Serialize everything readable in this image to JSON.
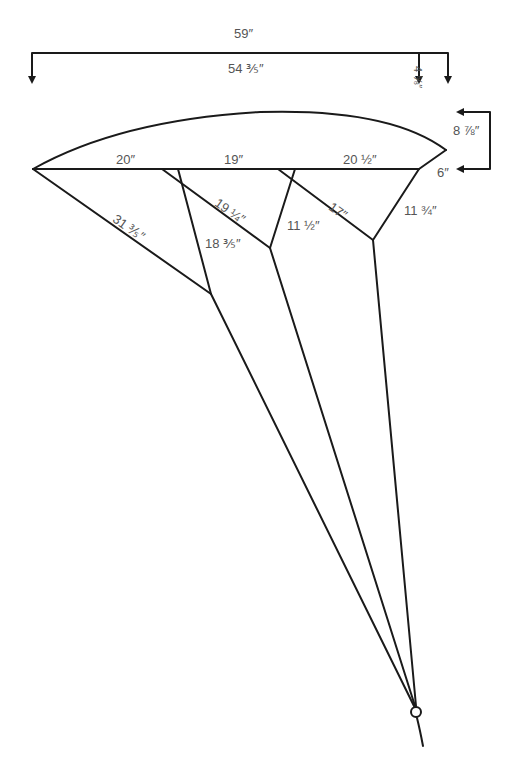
{
  "diagram": {
    "type": "kite-bridle-dimension-drawing",
    "line_color": "#1a1a1a",
    "label_color": "#555555",
    "overall_dimensions": {
      "total_span": "59″",
      "span_to_inner_mark": "54 ⅗″",
      "right_offset": "4 ⅝″",
      "wing_height": "8 ⅞″",
      "trailing_tip": "6″"
    },
    "baseline_segments": [
      {
        "label": "20″"
      },
      {
        "label": "19″"
      },
      {
        "label": "20 ½″"
      }
    ],
    "bridle_lines": [
      {
        "label": "31 ⅗″"
      },
      {
        "label": "19 ¼″"
      },
      {
        "label": "18 ⅗″"
      },
      {
        "label": "11 ½″"
      },
      {
        "label": "17″"
      },
      {
        "label": "11 ¾″"
      }
    ],
    "tow_point": "ring"
  }
}
